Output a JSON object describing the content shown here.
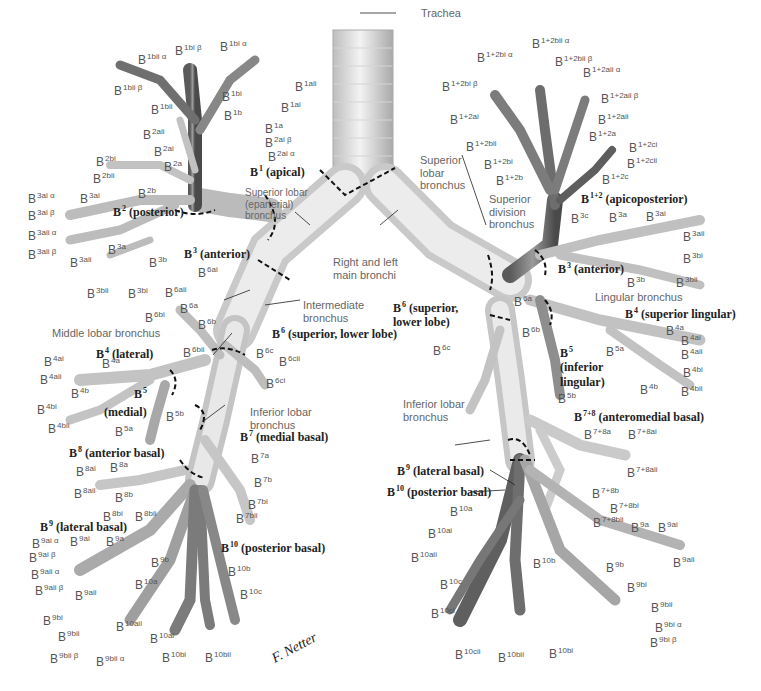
{
  "colors": {
    "bronchus_light": "#e4e4e4",
    "bronchus_mid": "#b8b8b8",
    "bronchus_dark": "#6e6e6e",
    "leader": "#222222",
    "label": "#555555",
    "bold_label": "#222222"
  },
  "center": {
    "trachea": "Trachea",
    "main_bronchi": [
      "Right and left",
      "main bronchi"
    ],
    "intermediate": [
      "Intermediate",
      "bronchus"
    ],
    "right_superior_lobar": [
      "Superior lobar",
      "(eparterial)",
      "bronchus"
    ],
    "middle_lobar": "Middle lobar bronchus",
    "right_inferior_lobar": [
      "Inferior lobar",
      "bronchus"
    ],
    "left_superior_lobar": [
      "Superior",
      "lobar",
      "bronchus"
    ],
    "superior_division": [
      "Superior",
      "division",
      "bronchus"
    ],
    "lingular": "Lingular bronchus",
    "left_inferior_lobar": [
      "Inferior lobar",
      "bronchus"
    ]
  },
  "segments": {
    "right": [
      {
        "num": "1",
        "name": "(apical)"
      },
      {
        "num": "2",
        "name": "(posterior)"
      },
      {
        "num": "3",
        "name": "(anterior)"
      },
      {
        "num": "4",
        "name": "(lateral)"
      },
      {
        "num": "5",
        "name": "(medial)"
      },
      {
        "num": "6",
        "name": "(superior, lower lobe)"
      },
      {
        "num": "7",
        "name": "(medial basal)"
      },
      {
        "num": "8",
        "name": "(anterior basal)"
      },
      {
        "num": "9",
        "name": "(lateral basal)"
      },
      {
        "num": "10",
        "name": "(posterior basal)"
      }
    ],
    "left": [
      {
        "num": "1+2",
        "name": "(apicoposterior)"
      },
      {
        "num": "3",
        "name": "(anterior)"
      },
      {
        "num": "4",
        "name": "(superior lingular)"
      },
      {
        "num": "5",
        "name": "(inferior lingular)"
      },
      {
        "num": "6",
        "name": "(superior, lower lobe)"
      },
      {
        "num": "7+8",
        "name": "(anteromedial basal)"
      },
      {
        "num": "9",
        "name": "(lateral basal)"
      },
      {
        "num": "10",
        "name": "(posterior basal)"
      }
    ]
  },
  "subsegments": {
    "right": [
      "1bi β",
      "1bi α",
      "1bii α",
      "1bii β",
      "1bi",
      "1bii",
      "1b",
      "1aii",
      "1ai",
      "1a",
      "2aii",
      "2ai β",
      "2ai",
      "2ai α",
      "2bi",
      "2a",
      "2bii",
      "2b",
      "3ai α",
      "3ai",
      "3ai β",
      "3aii α",
      "3a",
      "3aii β",
      "3aii",
      "3b",
      "3bii",
      "3bi",
      "6ai",
      "6aii",
      "6a",
      "6bi",
      "6b",
      "6bii",
      "6c",
      "6cii",
      "6ci",
      "4ai",
      "4a",
      "4aii",
      "4b",
      "4bi",
      "4bii",
      "5b",
      "5a",
      "7a",
      "7b",
      "7bi",
      "7bii",
      "8ai",
      "8a",
      "8aii",
      "8b",
      "8bi",
      "8bii",
      "9ai α",
      "9ai",
      "9a",
      "9ai β",
      "9b",
      "9aii α",
      "9aii β",
      "9aii",
      "10b",
      "10a",
      "10c",
      "9bi",
      "9bii",
      "10aii",
      "10ai",
      "9bii β",
      "9bii α",
      "10bi",
      "10bii"
    ],
    "left": [
      "1+2bii α",
      "1+2bi α",
      "1+2bii β",
      "1+2aii α",
      "1+2bi β",
      "1+2aii β",
      "1+2ai",
      "1+2aii",
      "1+2a",
      "1+2bii",
      "1+2ci",
      "1+2bi",
      "1+2cii",
      "1+2b",
      "1+2c",
      "3c",
      "3a",
      "3ai",
      "3aii",
      "3bi",
      "3b",
      "3bii",
      "6a",
      "6b",
      "6c",
      "4a",
      "4ai",
      "4aii",
      "4bi",
      "4b",
      "4bii",
      "5a",
      "5b",
      "7+8a",
      "7+8ai",
      "7+8aii",
      "7+8b",
      "7+8bi",
      "7+8bii",
      "9a",
      "9ai",
      "9aii",
      "10a",
      "10ai",
      "10aii",
      "10b",
      "10c",
      "9b",
      "9bi",
      "9bii",
      "10ci",
      "9bi α",
      "9bi β",
      "10cii",
      "10bii",
      "10bi"
    ]
  },
  "signature": "F. Netter"
}
